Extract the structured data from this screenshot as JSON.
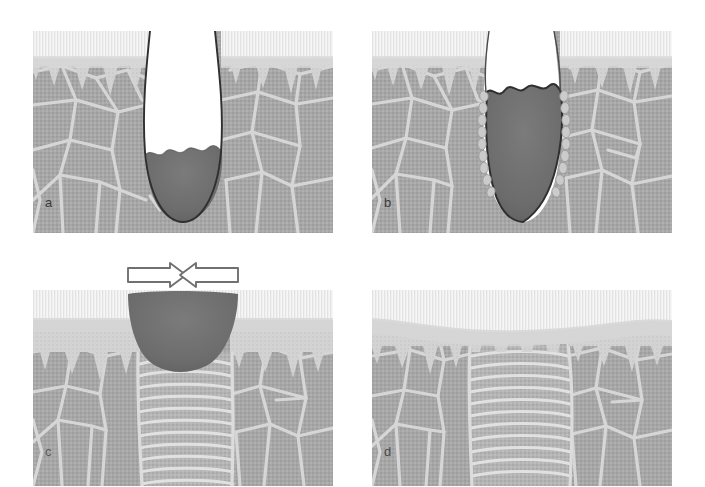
{
  "figure": {
    "background_color": "#ffffff",
    "width": 705,
    "height": 487,
    "panel_count": 4
  },
  "palette": {
    "stratum_corneum": "#f2f2f2",
    "stratum_corneum_stripe": "#e2e2e2",
    "epidermis": "#d4d4d4",
    "dermis": "#a8a8a8",
    "dermis_dark": "#9c9c9c",
    "collagen_line": "#d8d8d8",
    "eschar": "#6f6f6f",
    "eschar_dark": "#636363",
    "wound_outline": "#2e2e2e",
    "scar_band": "#bdbdbd",
    "scar_line": "#e0e0e0",
    "epithelial_cell": "#c9c9c9",
    "arrow_fill": "#ffffff",
    "arrow_outline": "#777777",
    "label_color": "#3b3b3b"
  },
  "panels": [
    {
      "id": "a",
      "label": "a",
      "caption": "Open deep wound with necrotic eschar at the base; epidermis interrupted at the wound margins",
      "bounds": {
        "x": 33,
        "y": 31,
        "width": 300,
        "height": 202
      },
      "label_pos": {
        "x": 12,
        "y": 172
      },
      "features": [
        "stratum-corneum",
        "epidermis",
        "rete-ridges",
        "dermis",
        "collagen-network",
        "wound-cavity",
        "eschar"
      ]
    },
    {
      "id": "b",
      "label": "b",
      "caption": "Wound filled with clot/eschar; chain of epithelial cells migrating down along both wound edges",
      "bounds": {
        "x": 372,
        "y": 31,
        "width": 300,
        "height": 202
      },
      "label_pos": {
        "x": 12,
        "y": 172
      },
      "features": [
        "stratum-corneum",
        "epidermis",
        "rete-ridges",
        "dermis",
        "collagen-network",
        "eschar-plug",
        "migrating-epithelial-cells"
      ]
    },
    {
      "id": "c",
      "label": "c",
      "caption": "Wound contraction: opposing arrows show margins drawing together; granulation/scar tissue forms beneath the lifting eschar",
      "bounds": {
        "x": 33,
        "y": 290,
        "width": 300,
        "height": 196
      },
      "label_pos": {
        "x": 12,
        "y": 166
      },
      "features": [
        "stratum-corneum",
        "epidermis",
        "rete-ridges",
        "dermis",
        "eschar-scab",
        "scar-tissue-bands",
        "contraction-arrows"
      ]
    },
    {
      "id": "d",
      "label": "d",
      "caption": "Healed wound: eschar shed, re-epithelialised surface slightly depressed, scar tissue with flattened rete ridges",
      "bounds": {
        "x": 372,
        "y": 290,
        "width": 300,
        "height": 196
      },
      "label_pos": {
        "x": 12,
        "y": 166
      },
      "features": [
        "stratum-corneum",
        "epidermis",
        "flattened-rete-ridges",
        "dermis",
        "scar-tissue-bands",
        "surface-depression"
      ]
    }
  ],
  "arrows": {
    "name": "contraction-arrows",
    "count": 2,
    "left_arrow_direction": "right",
    "right_arrow_direction": "left",
    "meaning": "wound contraction"
  }
}
